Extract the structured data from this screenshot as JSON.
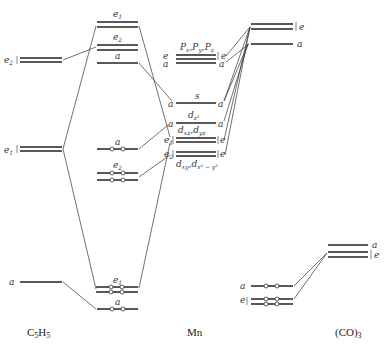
{
  "columns": {
    "left": "C5H5",
    "middle": "Mn",
    "right": "(CO)3"
  },
  "column_labels": {
    "left_main": "C",
    "left_sub1": "5",
    "left_mid": "H",
    "left_sub2": "5",
    "middle": "Mn",
    "right_main": "(CO)",
    "right_sub": "3"
  },
  "c5h5_levels": [
    {
      "sym": "e",
      "sub": "2",
      "degenerate": true
    },
    {
      "sym": "e",
      "sub": "1",
      "degenerate": true
    },
    {
      "sym": "a",
      "sub": "",
      "degenerate": false
    }
  ],
  "complex_levels": [
    {
      "label": "e1",
      "sym": "e",
      "sub": "1",
      "filled": false
    },
    {
      "label": "e2",
      "sym": "e",
      "sub": "2",
      "filled": false
    },
    {
      "label": "a",
      "sym": "a",
      "sub": "",
      "filled": false
    },
    {
      "label": "a",
      "sym": "a",
      "sub": "",
      "filled": true
    },
    {
      "label": "e2",
      "sym": "e",
      "sub": "2",
      "filled": true
    },
    {
      "label": "e1",
      "sym": "e",
      "sub": "1",
      "filled": true
    },
    {
      "label": "a",
      "sym": "a",
      "sub": "",
      "filled": true
    }
  ],
  "mn_levels": [
    {
      "orbital": "p_x, p_y, p_z",
      "left_syms": [
        "e",
        "a"
      ],
      "right_syms": [
        "e",
        "a"
      ]
    },
    {
      "orbital": "s",
      "left_syms": [
        "a"
      ],
      "right_syms": [
        "a"
      ]
    },
    {
      "orbital": "d_z2",
      "left_syms": [
        "a"
      ],
      "right_syms": [
        "a"
      ]
    },
    {
      "orbital": "d_xz, d_yz",
      "left_syms": [
        "e1"
      ],
      "right_syms": [
        "e"
      ]
    },
    {
      "orbital": "d_xy, d_x2-y2",
      "left_syms": [
        "e2"
      ],
      "right_syms": [
        "e"
      ]
    }
  ],
  "mn_labels": {
    "p": "P",
    "px_sub": "x",
    "py_sub": "y",
    "pz_sub": "z",
    "s": "s",
    "dz2": "d",
    "dz2_sub": "z²",
    "dxz": "d",
    "dxz_sub": "xz",
    "dyz_sub": "yz",
    "dxy": "d",
    "dxy_sub": "xy",
    "dx2y2_sub": "x² − y²",
    "comma": ","
  },
  "upper_complex_levels": [
    {
      "sym": "e",
      "degenerate": true
    },
    {
      "sym": "a",
      "degenerate": false
    }
  ],
  "co3_levels": [
    {
      "sym": "a",
      "position": "upper",
      "filled": false
    },
    {
      "sym": "e",
      "position": "upper",
      "filled": false
    },
    {
      "sym": "a",
      "position": "lower",
      "filled": true
    },
    {
      "sym": "e",
      "position": "lower",
      "filled": true
    }
  ],
  "symbols": {
    "a": "a",
    "e": "e",
    "one": "1",
    "two": "2",
    "brace": "{",
    "bar": "|"
  }
}
